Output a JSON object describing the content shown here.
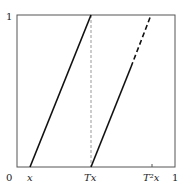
{
  "diagram": {
    "type": "piecewise-linear map graph",
    "y_axis": {
      "top_label": "1"
    },
    "x_axis": {
      "origin_label": "0",
      "ticks": [
        {
          "label": "x",
          "pos": 0.085
        },
        {
          "label": "Tx",
          "pos": 0.468
        },
        {
          "label": "T²x",
          "pos": 0.855
        },
        {
          "label": "1",
          "pos": 1.0
        }
      ]
    },
    "segments": [
      {
        "name": "branch-1",
        "from": [
          0.085,
          0
        ],
        "to": [
          0.468,
          1
        ],
        "style": "solid"
      },
      {
        "name": "branch-2-solid",
        "from": [
          0.468,
          0
        ],
        "to": [
          0.72,
          0.66
        ],
        "style": "solid"
      },
      {
        "name": "branch-2-dashed",
        "from": [
          0.72,
          0.66
        ],
        "to": [
          0.848,
          1
        ],
        "style": "dashed"
      },
      {
        "name": "vertical-guide",
        "from": [
          0.468,
          0
        ],
        "to": [
          0.468,
          1
        ],
        "style": "dashed-gray"
      }
    ],
    "colors": {
      "line": "#111111",
      "guide": "#999999",
      "frame": "#555555"
    }
  }
}
